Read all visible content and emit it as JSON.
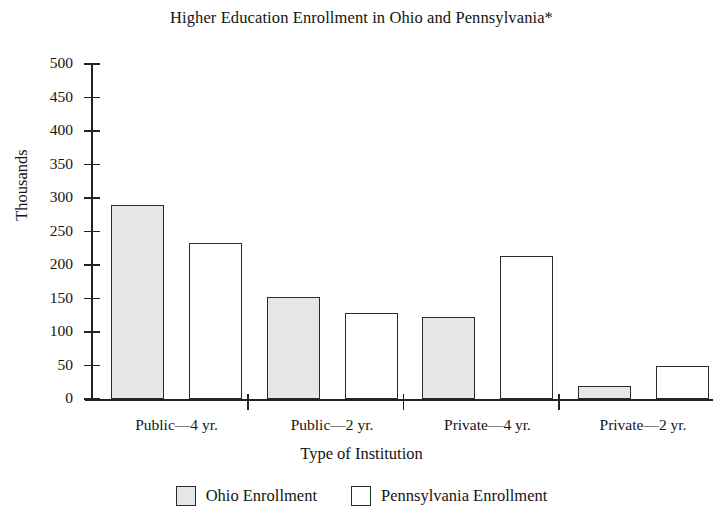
{
  "chart_data": {
    "type": "bar",
    "title": "Higher Education Enrollment in Ohio and Pennsylvania*",
    "xlabel": "Type of Institution",
    "ylabel": "Thousands",
    "categories": [
      "Public—4 yr.",
      "Public—2 yr.",
      "Private—4 yr.",
      "Private—2 yr."
    ],
    "series": [
      {
        "name": "Ohio Enrollment",
        "values": [
          290,
          152,
          122,
          20
        ],
        "color": "#e6e6e6"
      },
      {
        "name": "Pennsylvania Enrollment",
        "values": [
          233,
          128,
          213,
          50
        ],
        "color": "#ffffff"
      }
    ],
    "ylim": [
      0,
      500
    ],
    "yticks": [
      0,
      50,
      100,
      150,
      200,
      250,
      300,
      350,
      400,
      450,
      500
    ],
    "ytick_labels": [
      "0",
      "50",
      "100",
      "150",
      "200",
      "250",
      "300",
      "350",
      "400",
      "450",
      "500"
    ],
    "grid": false,
    "legend_position": "bottom"
  },
  "legend": {
    "items": [
      {
        "label": "Ohio Enrollment",
        "swatch": "ohio"
      },
      {
        "label": "Pennsylvania Enrollment",
        "swatch": "penn"
      }
    ]
  }
}
